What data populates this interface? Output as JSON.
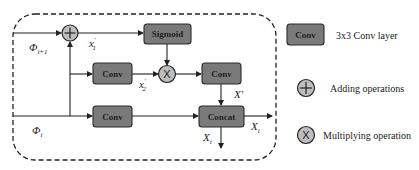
{
  "diagram": {
    "type": "block-diagram",
    "colors": {
      "box_fill": "#7a7a7a",
      "box_stroke": "#2a2a2a",
      "circle_fill": "#bdbdbd",
      "line": "#222222",
      "dashed_border": "#222222"
    },
    "nodes": {
      "sigmoid": {
        "label": "Sigmoid"
      },
      "conv_mid": {
        "label": "Conv"
      },
      "conv_right": {
        "label": "Conv"
      },
      "conv_bottom": {
        "label": "Conv"
      },
      "concat": {
        "label": "Concat"
      },
      "add_op": {
        "label": "+"
      },
      "mul_op": {
        "label": "X"
      }
    },
    "labels": {
      "phi_i1": {
        "main": "Φ",
        "sub": "i+1"
      },
      "phi_i": {
        "main": "Φ",
        "sub": "i"
      },
      "x1p": {
        "main": "x",
        "sub": "1",
        "sup": "′"
      },
      "x2p": {
        "main": "x",
        "sub": "2",
        "sup": "′"
      },
      "Xp": {
        "main": "X′"
      },
      "Xi_right": {
        "main": "X",
        "sub": "i"
      },
      "Xi_down": {
        "main": "X",
        "sub": "i"
      }
    }
  },
  "legend": {
    "items": [
      {
        "symbol": "Conv",
        "text": "3x3 Conv layer"
      },
      {
        "symbol": "+",
        "text": "Adding operations"
      },
      {
        "symbol": "X",
        "text": "Multiplying operation"
      }
    ]
  }
}
